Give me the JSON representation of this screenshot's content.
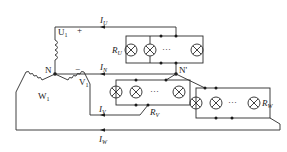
{
  "diagram": {
    "type": "three-phase four-wire star-connected lamp load circuit",
    "source_node": "N",
    "load_node": "N'",
    "windings": [
      {
        "name": "U",
        "sub": "1"
      },
      {
        "name": "V",
        "sub": "1"
      },
      {
        "name": "W",
        "sub": "1"
      }
    ],
    "currents": [
      {
        "name": "I",
        "sub": "U"
      },
      {
        "name": "I",
        "sub": "N"
      },
      {
        "name": "I",
        "sub": "V"
      },
      {
        "name": "I",
        "sub": "W"
      }
    ],
    "loads": [
      {
        "name": "R",
        "sub": "U"
      },
      {
        "name": "R",
        "sub": "V"
      },
      {
        "name": "R",
        "sub": "W"
      }
    ],
    "polarity": {
      "plus": "+",
      "minus": "−"
    },
    "ellipsis": "···",
    "colors": {
      "line": "#2a2a2a",
      "background": "#ffffff"
    }
  }
}
